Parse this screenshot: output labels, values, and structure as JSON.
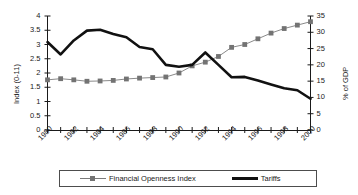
{
  "chart_data": {
    "type": "line",
    "title": "",
    "xlabel": "",
    "ylabel": "Index (0-11)",
    "ylabel_secondary": "% of GDP",
    "grid": false,
    "legend_position": "bottom",
    "x": [
      1980,
      1981,
      1982,
      1983,
      1984,
      1985,
      1986,
      1987,
      1988,
      1989,
      1990,
      1991,
      1992,
      1993,
      1994,
      1995,
      1996,
      1997,
      1998,
      1999,
      2000
    ],
    "xlim": [
      1980,
      2000
    ],
    "ylim": [
      0,
      4
    ],
    "ylim_secondary": [
      0,
      35
    ],
    "yticks": [
      "0",
      "0.5",
      "1",
      "1.5",
      "2",
      "2.5",
      "3",
      "3.5",
      "4"
    ],
    "yticks_secondary": [
      "0",
      "5",
      "10",
      "15",
      "20",
      "25",
      "30",
      "35"
    ],
    "xticks": [
      "1980",
      "1982",
      "1984",
      "1986",
      "1988",
      "1990",
      "1992",
      "1994",
      "1996",
      "1998",
      "2000"
    ],
    "series": [
      {
        "name": "Financial Openness Index",
        "axis": "left",
        "marker": "square",
        "color": "#737373",
        "values": [
          1.76,
          1.8,
          1.76,
          1.71,
          1.72,
          1.74,
          1.79,
          1.82,
          1.84,
          1.86,
          2.0,
          2.25,
          2.38,
          2.58,
          2.9,
          3.0,
          3.2,
          3.4,
          3.56,
          3.68,
          3.8
        ]
      },
      {
        "name": "Tariffs",
        "axis": "right",
        "marker": "none",
        "color": "#111111",
        "values": [
          27.0,
          23.2,
          27.5,
          30.5,
          30.8,
          29.5,
          28.5,
          25.5,
          24.8,
          20.0,
          19.4,
          20.0,
          23.8,
          20.0,
          16.2,
          16.3,
          15.2,
          14.0,
          12.8,
          12.2,
          9.6
        ]
      }
    ]
  },
  "legend": {
    "items": [
      {
        "label": "Financial Openness Index"
      },
      {
        "label": "Tariffs"
      }
    ]
  }
}
